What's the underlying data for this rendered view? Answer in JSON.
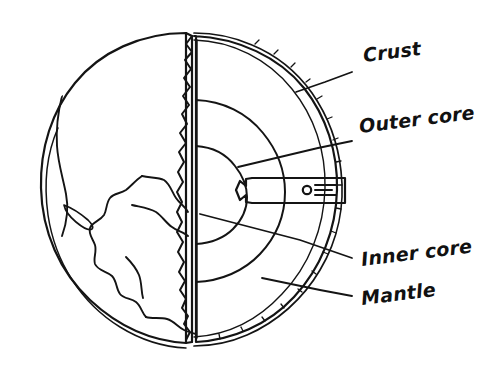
{
  "figure": {
    "background_color": "#ffffff",
    "ink_color": "#141414"
  },
  "labels": [
    {
      "id": "crust",
      "text": "Crust",
      "x": 364,
      "y": 62,
      "rotation": -7,
      "leader": "M 352,72 L 325,82 L 296,92"
    },
    {
      "id": "outer-core",
      "text": "Outer core",
      "x": 360,
      "y": 133,
      "rotation": -7,
      "leader": "M 352,141 L 318,148 L 238,167"
    },
    {
      "id": "inner-core",
      "text": "Inner core",
      "x": 362,
      "y": 266,
      "rotation": -7,
      "leader": "M 352,258 L 300,240 L 200,214"
    },
    {
      "id": "mantle",
      "text": "Mantle",
      "x": 362,
      "y": 305,
      "rotation": -7,
      "leader": "M 352,296 L 320,290 L 262,278"
    }
  ],
  "layers": [
    {
      "id": "outer-space-globe",
      "name": "globe-body",
      "fill": "#ffffff"
    },
    {
      "id": "mantle-layer",
      "name": "mantle",
      "fill": "#e6e6e6"
    },
    {
      "id": "outer-core-layer",
      "name": "outer-core",
      "fill": "#c6c6c6"
    },
    {
      "id": "inner-core-layer",
      "name": "inner-core",
      "fill": "#a5a5a5"
    },
    {
      "id": "crust-band",
      "name": "crust-band",
      "fill": "#dedede"
    }
  ],
  "callout_marker": {
    "id": "wedge-symbol",
    "description": "small circle with three horizontal lines inside white wedge",
    "circle_x": 307,
    "circle_y": 190,
    "circle_r": 4.2
  },
  "colors": {
    "mantle": "#e6e6e6",
    "outer_core": "#c6c6c6",
    "inner_core": "#a5a5a5",
    "crust_band": "#dedede",
    "ocean": "#ffffff",
    "ink": "#141414"
  }
}
